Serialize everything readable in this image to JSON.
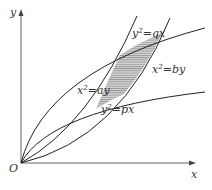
{
  "figure": {
    "axes": {
      "x_label": "x",
      "y_label": "y",
      "origin_label": "O"
    },
    "curves": [
      {
        "name": "y2-qx",
        "eq_base": "y",
        "eq_exp": "2",
        "eq_rest": "=qx"
      },
      {
        "name": "x2-by",
        "eq_base": "x",
        "eq_exp": "2",
        "eq_rest": "=by"
      },
      {
        "name": "x2-ay",
        "eq_base": "x",
        "eq_exp": "2",
        "eq_rest": "=ay"
      },
      {
        "name": "y2-px",
        "eq_base": "y",
        "eq_exp": "2",
        "eq_rest": "=px"
      }
    ],
    "shaded_region": "region bounded by the four parabolas",
    "colors": {
      "stroke": "#222222",
      "axis": "#555555",
      "hatch": "#888888",
      "fill": "#bdbdbd"
    }
  }
}
